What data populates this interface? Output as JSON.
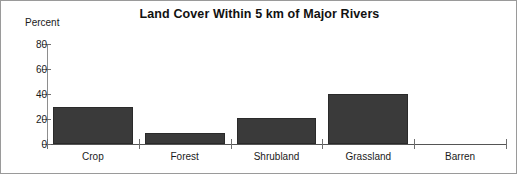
{
  "chart_data": {
    "type": "bar",
    "title": "Land Cover Within 5 km of Major Rivers",
    "xlabel": "",
    "ylabel": "Percent",
    "categories": [
      "Crop",
      "Forest",
      "Shrubland",
      "Grassland",
      "Barren"
    ],
    "values": [
      30,
      9,
      21,
      40,
      0
    ],
    "ylim": [
      0,
      80
    ],
    "yticks": [
      0,
      20,
      40,
      60,
      80
    ],
    "ytick_labels": [
      "0",
      "20",
      "40",
      "60",
      "80"
    ],
    "grid": false,
    "legend": "none",
    "bar_color": "#3a3a3a",
    "background_color": "#ffffff",
    "axis_color": "#6f6f6f",
    "text_color": "#1a1a1a"
  }
}
